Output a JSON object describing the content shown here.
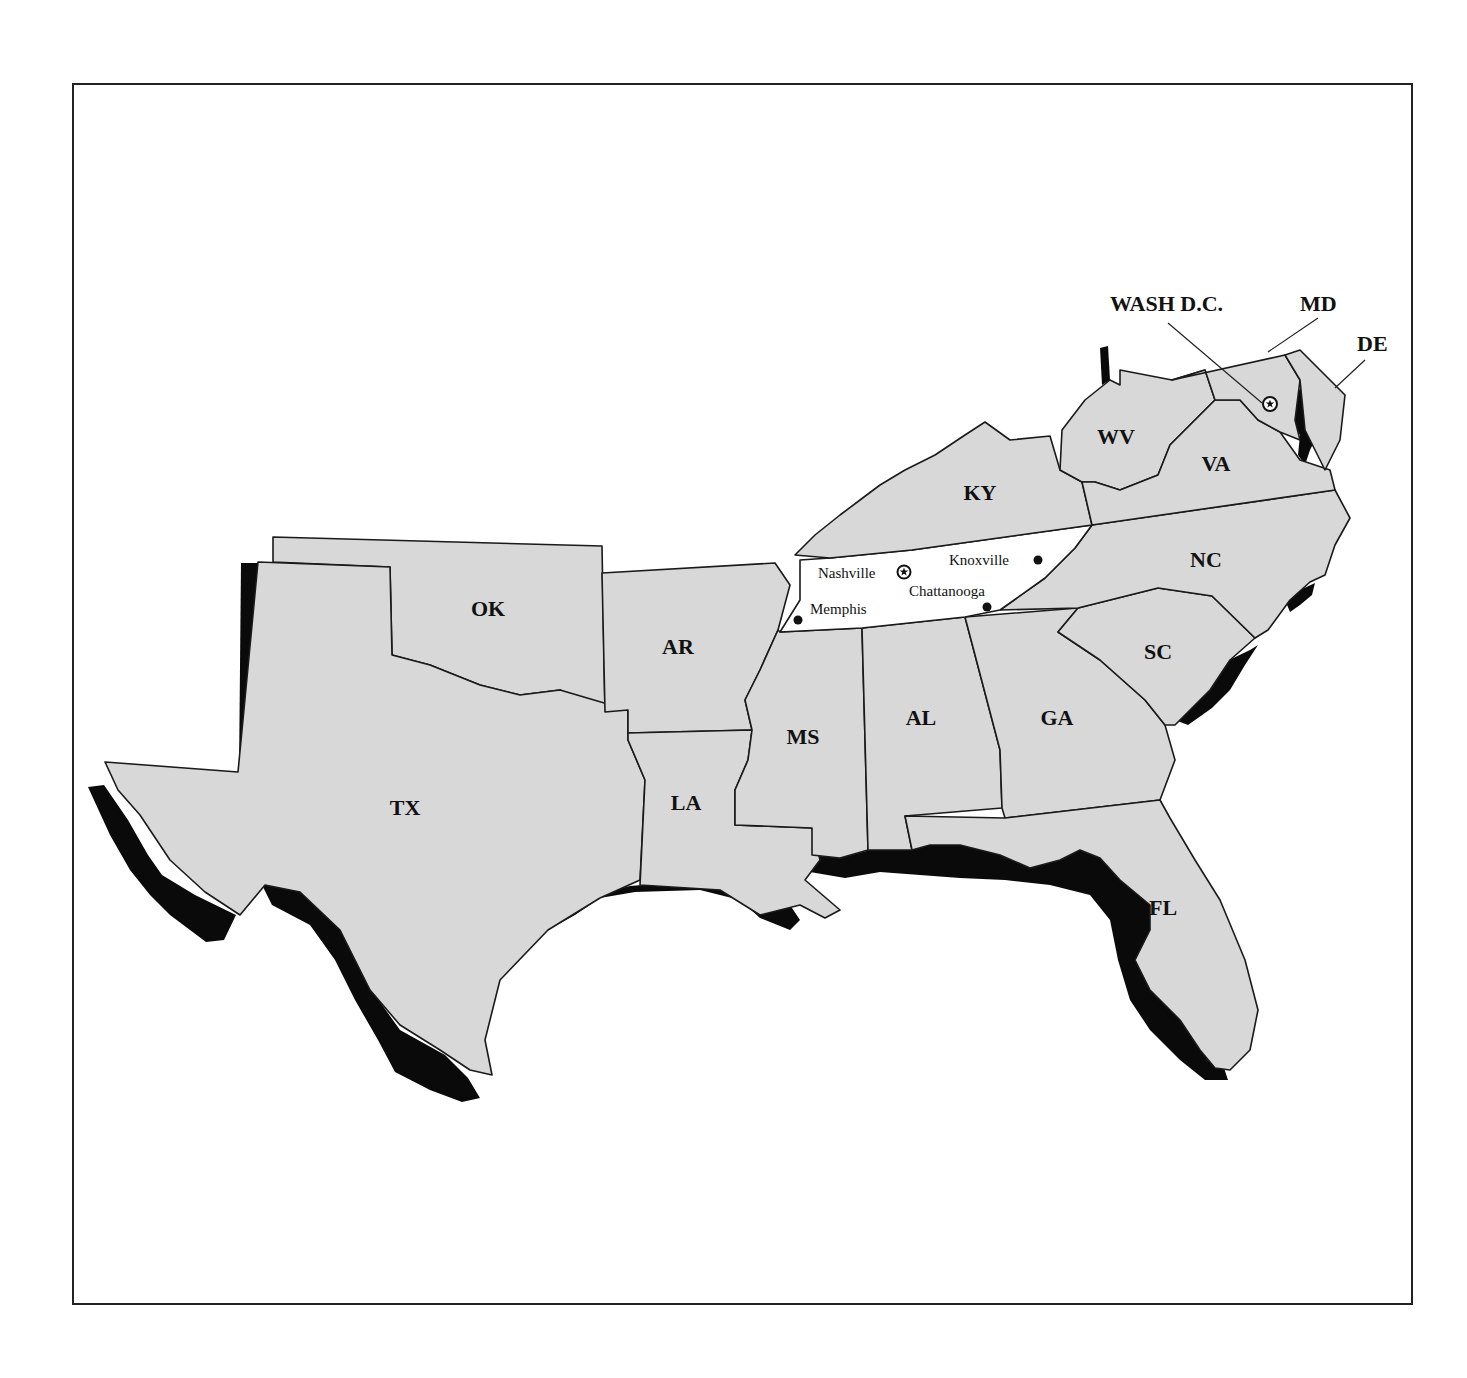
{
  "map": {
    "title": "",
    "colors": {
      "state_fill": "#d8d8d8",
      "highlight_fill": "#ffffff",
      "coast_shadow": "#0a0a0a",
      "border": "#1a1a1a"
    },
    "highlighted_state": "TN",
    "states": [
      {
        "abbr": "TX",
        "x": 405,
        "y": 815
      },
      {
        "abbr": "OK",
        "x": 488,
        "y": 616
      },
      {
        "abbr": "AR",
        "x": 678,
        "y": 654
      },
      {
        "abbr": "LA",
        "x": 686,
        "y": 810
      },
      {
        "abbr": "MS",
        "x": 803,
        "y": 744
      },
      {
        "abbr": "AL",
        "x": 921,
        "y": 725
      },
      {
        "abbr": "GA",
        "x": 1057,
        "y": 725
      },
      {
        "abbr": "FL",
        "x": 1163,
        "y": 915
      },
      {
        "abbr": "SC",
        "x": 1158,
        "y": 659
      },
      {
        "abbr": "NC",
        "x": 1206,
        "y": 567
      },
      {
        "abbr": "KY",
        "x": 980,
        "y": 500
      },
      {
        "abbr": "WV",
        "x": 1116,
        "y": 444
      },
      {
        "abbr": "VA",
        "x": 1216,
        "y": 471
      }
    ],
    "callouts": [
      {
        "label": "WASH D.C.",
        "x": 1110,
        "y": 311
      },
      {
        "label": "MD",
        "x": 1300,
        "y": 311
      },
      {
        "label": "DE",
        "x": 1357,
        "y": 351
      }
    ],
    "cities": [
      {
        "name": "Nashville",
        "marker": "star-capital",
        "label_x": 818,
        "label_y": 578
      },
      {
        "name": "Knoxville",
        "marker": "dot",
        "label_x": 949,
        "label_y": 565
      },
      {
        "name": "Chattanooga",
        "marker": "dot",
        "label_x": 909,
        "label_y": 596
      },
      {
        "name": "Memphis",
        "marker": "dot",
        "label_x": 810,
        "label_y": 614
      }
    ],
    "capital_marker": "Washington D.C. star"
  }
}
